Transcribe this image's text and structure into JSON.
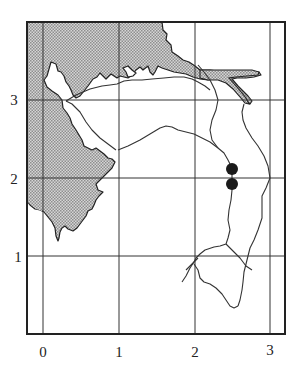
{
  "map": {
    "frame": {
      "left": 27,
      "top": 22,
      "right": 285,
      "bottom": 334
    },
    "grid": {
      "x_ticks": [
        {
          "label": "0",
          "px": 43
        },
        {
          "label": "1",
          "px": 119
        },
        {
          "label": "2",
          "px": 195
        },
        {
          "label": "3",
          "px": 270
        }
      ],
      "y_ticks": [
        {
          "label": "3",
          "px": 100
        },
        {
          "label": "2",
          "px": 178
        },
        {
          "label": "1",
          "px": 256
        }
      ]
    },
    "colors": {
      "frame": "#222222",
      "grid": "#333333",
      "land_shading": "#b9b9b9",
      "river": "#333333",
      "marker": "#1a1a1a"
    },
    "markers": [
      {
        "name": "site-1",
        "x": 232,
        "y": 169,
        "r": 6
      },
      {
        "name": "site-2",
        "x": 232,
        "y": 184,
        "r": 6
      }
    ]
  }
}
